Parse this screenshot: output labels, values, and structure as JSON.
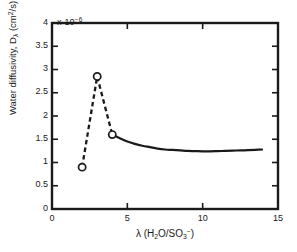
{
  "chart_data": {
    "type": "line",
    "title": "",
    "xlabel": "λ (H₂O/SO₃⁻)",
    "ylabel": "Water diffusivity, Dλ (cm²/s)",
    "y_multiplier": "x 10⁻⁶",
    "y_multiplier_base": "x 10",
    "y_multiplier_exponent": "-6",
    "xlim": [
      0,
      15
    ],
    "ylim": [
      0,
      4
    ],
    "xticks": [
      0,
      5,
      10,
      15
    ],
    "yticks": [
      0,
      0.5,
      1,
      1.5,
      2,
      2.5,
      3,
      3.5,
      4
    ],
    "xtick_labels": [
      "0",
      "5",
      "10",
      "15"
    ],
    "ytick_labels": [
      "0",
      "0.5",
      "1",
      "1.5",
      "2",
      "2.5",
      "3",
      "3.5",
      "4"
    ],
    "grid": false,
    "legend": null,
    "axis_color": "#1a1a1a",
    "series": [
      {
        "name": "dashed-segment-markers",
        "style": "dashed",
        "marker": "open-circle",
        "x": [
          2,
          3,
          4
        ],
        "values": [
          0.9,
          2.85,
          1.6
        ],
        "units": "1e-6 cm^2/s"
      },
      {
        "name": "solid-curve",
        "style": "solid",
        "marker": "none",
        "x": [
          4,
          4.5,
          5,
          5.5,
          6,
          6.5,
          7,
          7.5,
          8,
          8.5,
          9,
          9.5,
          10,
          10.5,
          11,
          11.5,
          12,
          12.5,
          13,
          13.5,
          14
        ],
        "values": [
          1.6,
          1.52,
          1.45,
          1.4,
          1.36,
          1.33,
          1.3,
          1.28,
          1.27,
          1.26,
          1.25,
          1.245,
          1.24,
          1.24,
          1.245,
          1.25,
          1.255,
          1.26,
          1.265,
          1.272,
          1.28
        ],
        "units": "1e-6 cm^2/s"
      }
    ],
    "annotations": []
  },
  "axes": {
    "x_label_parts": {
      "lambda": "λ",
      "open": " (H",
      "sub2": "2",
      "mid": "O/SO",
      "sub3": "3",
      "sup_minus": "−",
      "close": ")"
    },
    "y_label_parts": {
      "main": "Water diffusivity, D",
      "sub_lambda": "λ",
      "units_open": " (cm",
      "sup2": "2",
      "units_close": "/s)"
    },
    "multiplier_parts": {
      "base": "x 10",
      "exponent": "−6"
    }
  }
}
